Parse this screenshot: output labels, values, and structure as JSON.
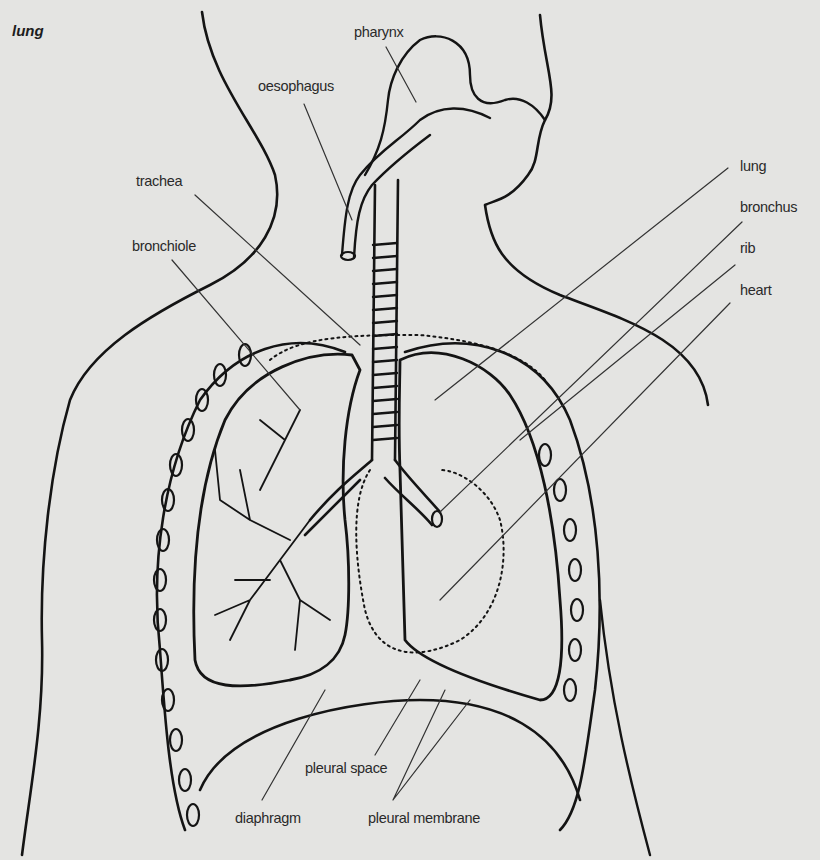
{
  "diagram": {
    "title": "lung",
    "labels": {
      "pharynx": "pharynx",
      "oesophagus": "oesophagus",
      "trachea": "trachea",
      "bronchiole": "bronchiole",
      "lung": "lung",
      "bronchus": "bronchus",
      "rib": "rib",
      "heart": "heart",
      "pleural_space": "pleural space",
      "diaphragm": "diaphragm",
      "pleural_membrane": "pleural membrane"
    },
    "colors": {
      "background": "#e4e4e2",
      "ink": "#141414",
      "text": "#2a2a2a"
    }
  }
}
